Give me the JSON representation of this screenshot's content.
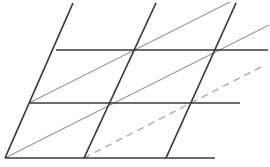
{
  "figure": {
    "canvas": {
      "width": 270,
      "height": 167,
      "background": "#ffffff"
    },
    "colors": {
      "dark_line": "#3a3a3a",
      "gray_line": "#9a9a9a",
      "dashed_line": "#b0b0b0",
      "background": "#ffffff"
    },
    "stroke_widths": {
      "dark_line": 1.7,
      "gray_line": 1.3,
      "dashed_line": 1.5
    },
    "dash_pattern": "7 5"
  },
  "chart_data": {
    "type": "line",
    "xlabel": "",
    "ylabel": "",
    "xlim": [
      0,
      270
    ],
    "ylim": [
      0,
      167
    ],
    "grid": false,
    "legend": "none",
    "series": [
      {
        "name": "horizontal-top",
        "style": "solid",
        "color": "#3a3a3a",
        "width": 1.7,
        "x": [
          56,
          268
        ],
        "y": [
          50,
          50
        ]
      },
      {
        "name": "horizontal-middle",
        "style": "solid",
        "color": "#3a3a3a",
        "width": 1.7,
        "x": [
          29,
          240
        ],
        "y": [
          103,
          103
        ]
      },
      {
        "name": "horizontal-bottom",
        "style": "solid",
        "color": "#3a3a3a",
        "width": 1.7,
        "x": [
          5,
          215
        ],
        "y": [
          158,
          158
        ]
      },
      {
        "name": "steep-diagonal-left",
        "style": "solid",
        "color": "#3a3a3a",
        "width": 1.7,
        "x": [
          5,
          73
        ],
        "y": [
          158,
          3
        ]
      },
      {
        "name": "steep-diagonal-middle",
        "style": "solid",
        "color": "#3a3a3a",
        "width": 1.7,
        "x": [
          84,
          156
        ],
        "y": [
          158,
          3
        ]
      },
      {
        "name": "steep-diagonal-right",
        "style": "solid",
        "color": "#3a3a3a",
        "width": 1.7,
        "x": [
          166,
          236
        ],
        "y": [
          158,
          3
        ]
      },
      {
        "name": "shallow-diagonal-upper",
        "style": "solid",
        "color": "#9a9a9a",
        "width": 1.3,
        "x": [
          29,
          230
        ],
        "y": [
          103,
          2
        ]
      },
      {
        "name": "shallow-diagonal-lower",
        "style": "solid",
        "color": "#9a9a9a",
        "width": 1.3,
        "x": [
          5,
          269
        ],
        "y": [
          158,
          25
        ]
      },
      {
        "name": "shallow-diagonal-dashed",
        "style": "dashed",
        "color": "#b0b0b0",
        "width": 1.5,
        "x": [
          84,
          261
        ],
        "y": [
          158,
          67
        ]
      }
    ],
    "vertices": [
      {
        "name": "origin-bottom-left",
        "x": 5,
        "y": 158
      },
      {
        "name": "bottom-mid",
        "x": 84,
        "y": 158
      },
      {
        "name": "bottom-right-node",
        "x": 166,
        "y": 158
      },
      {
        "name": "mid-left",
        "x": 29,
        "y": 103
      },
      {
        "name": "mid-center",
        "x": 108,
        "y": 103
      },
      {
        "name": "mid-right",
        "x": 190,
        "y": 103
      },
      {
        "name": "top-left",
        "x": 56,
        "y": 50
      },
      {
        "name": "top-center",
        "x": 135,
        "y": 50
      },
      {
        "name": "top-right",
        "x": 217,
        "y": 50
      }
    ]
  }
}
